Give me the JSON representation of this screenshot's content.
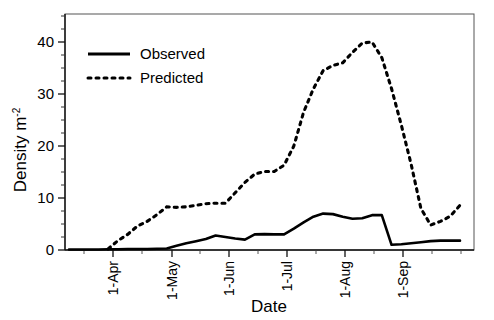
{
  "figure": {
    "faint_cut_title": "",
    "background": "#ffffff",
    "line_color": "#000000"
  },
  "axes": {
    "y_label_main": "Density m",
    "y_label_exponent": "-2",
    "x_label": "Date",
    "y_ticks": [
      "0",
      "10",
      "20",
      "30",
      "40"
    ],
    "x_ticks": [
      "1-Apr",
      "1-May",
      "1-Jun",
      "1-Jul",
      "1-Aug",
      "1-Sep"
    ]
  },
  "legend": {
    "items": [
      {
        "label": "Observed",
        "style": "solid",
        "color": "#000000"
      },
      {
        "label": "Predicted",
        "style": "dotted",
        "color": "#000000"
      }
    ]
  },
  "chart_data": {
    "type": "line",
    "title": "",
    "xlabel": "Date",
    "ylabel": "Density m-2",
    "ylim": [
      0,
      44
    ],
    "xlim": [
      0,
      27
    ],
    "grid": false,
    "legend_position": "top-left",
    "x_tick_labels": [
      "1-Apr",
      "1-May",
      "1-Jun",
      "1-Jul",
      "1-Aug",
      "1-Sep"
    ],
    "x_tick_values": [
      3.3,
      9.2,
      14.9,
      20.7,
      26.5,
      32.3
    ],
    "y_tick_values": [
      0,
      10,
      20,
      30,
      40
    ],
    "x": [
      0,
      1,
      2,
      3,
      4,
      5,
      6,
      7,
      8,
      9,
      10,
      11,
      12,
      13,
      14,
      15,
      16,
      17,
      18,
      19,
      20,
      21,
      22,
      23,
      24,
      25,
      26,
      27,
      28,
      29,
      30,
      31,
      32,
      33,
      34,
      35,
      36,
      37,
      38,
      39,
      40
    ],
    "series": [
      {
        "name": "Observed",
        "style": "solid",
        "values": [
          0.1,
          0.1,
          0.1,
          0.1,
          0.15,
          0.15,
          0.2,
          0.2,
          0.2,
          0.25,
          0.3,
          0.8,
          1.3,
          1.7,
          2.1,
          2.8,
          2.5,
          2.2,
          2.0,
          3.0,
          3.05,
          3.0,
          3.0,
          4.1,
          5.3,
          6.4,
          7.0,
          6.9,
          6.4,
          6.0,
          6.1,
          6.7,
          6.7,
          1.0,
          1.1,
          1.3,
          1.5,
          1.7,
          1.8,
          1.8,
          1.8
        ]
      },
      {
        "name": "Predicted",
        "style": "dotted",
        "values": [
          null,
          null,
          null,
          null,
          0.2,
          1.8,
          3.0,
          4.6,
          5.5,
          6.8,
          8.3,
          8.2,
          8.3,
          8.6,
          8.9,
          9.0,
          9.0,
          11.0,
          13.0,
          14.6,
          15.1,
          15.1,
          16.3,
          20.0,
          26.5,
          31.0,
          34.5,
          35.5,
          36.0,
          38.0,
          39.8,
          40.0,
          37.0,
          31.0,
          24.0,
          16.5,
          8.0,
          4.8,
          5.5,
          6.5,
          8.6
        ]
      }
    ]
  }
}
